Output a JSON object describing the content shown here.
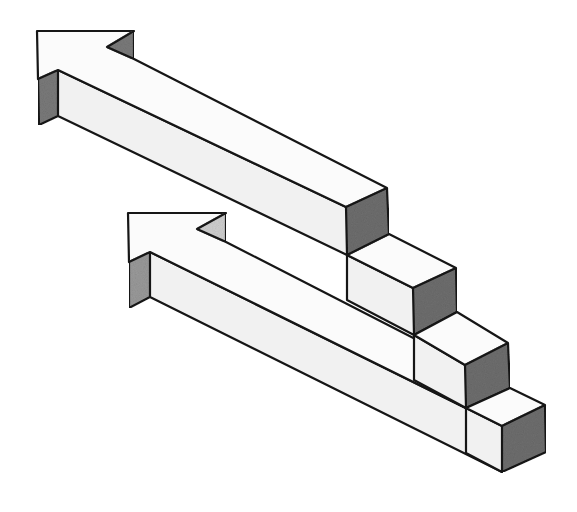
{
  "image": {
    "description": "Hand-drawn pencil sketch of an impossible staircase formed by two 3D arrows pointing up-left",
    "title": "Impossible arrows staircase"
  },
  "colors": {
    "background": "#ffffff",
    "top_face": "#fbfbfb",
    "front_face": "#f1f1f1",
    "shaded_face": "#6e6e6e",
    "light_shade": "#bdbdbd",
    "outline": "#161616"
  },
  "shapes": {
    "upper_arrow": {
      "head_top": "37,31 134,31 107,47 134,59 387,188 346,207 58,70 38,79",
      "notch_shade": "107,47 134,31 134,59",
      "front": "58,70 346,207 347,255 58,116",
      "left_shade": "38,79 58,70 58,116 39,125",
      "end_cap": "346,207 387,188 389,234 347,255"
    },
    "steps": [
      {
        "top": "347,255 389,234 456,268 413,288",
        "cap": "413,288 456,268 457,312 414,335",
        "front": "347,255 413,288 414,335 347,300"
      },
      {
        "top": "414,335 457,312 508,343 465,365",
        "cap": "465,365 508,343 510,388 466,408",
        "front": "414,335 465,365 466,408 414,380"
      },
      {
        "top": "466,408 510,388 545,405 502,426",
        "cap": "502,426 545,405 546,452 502,472",
        "front": "466,408 502,426 502,472 466,453"
      }
    ],
    "lower_arrow": {
      "head_top": "128,213 226,213 197,229 226,242 466,365 466,408 150,252 129,262",
      "notch_shade": "197,229 226,213 226,242",
      "front": "150,252 502,426 502,472 150,297",
      "left_shade": "129,262 150,252 150,297 129,308"
    },
    "lines": [
      "226,242 414,335",
      "150,297 502,472"
    ]
  }
}
